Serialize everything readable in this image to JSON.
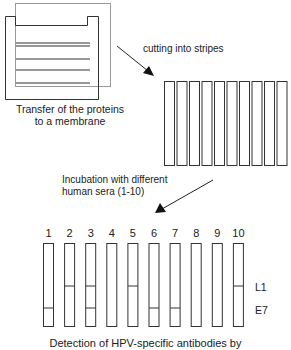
{
  "diagram": {
    "step1": {
      "caption_line1": "Transfer of the proteins",
      "caption_line2": "to a membrane"
    },
    "step2": {
      "arrow_label": "cutting into stripes",
      "stripe_count": 10
    },
    "step3": {
      "arrow_label_line1": "Incubation with different",
      "arrow_label_line2": "human sera (1-10)"
    },
    "results": {
      "band_labels": {
        "l1": "L1",
        "e7": "E7"
      },
      "strips": [
        {
          "number": "1",
          "l1": false,
          "e7": true
        },
        {
          "number": "2",
          "l1": true,
          "e7": false
        },
        {
          "number": "3",
          "l1": true,
          "e7": true
        },
        {
          "number": "4",
          "l1": false,
          "e7": false
        },
        {
          "number": "5",
          "l1": true,
          "e7": false
        },
        {
          "number": "6",
          "l1": false,
          "e7": true
        },
        {
          "number": "7",
          "l1": false,
          "e7": true
        },
        {
          "number": "8",
          "l1": false,
          "e7": false
        },
        {
          "number": "9",
          "l1": false,
          "e7": false
        },
        {
          "number": "10",
          "l1": true,
          "e7": false
        }
      ]
    },
    "caption": "Detection of HPV-specific antibodies by"
  }
}
